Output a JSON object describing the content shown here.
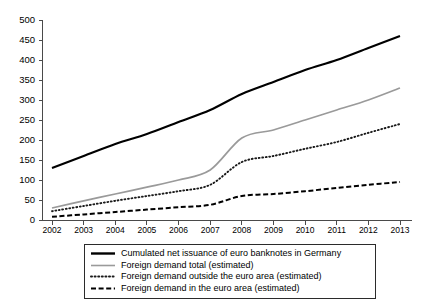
{
  "chart_data": {
    "type": "line",
    "title": "",
    "subtitle": "",
    "xlabel": "",
    "ylabel": "",
    "categories": [
      "2002",
      "2003",
      "2004",
      "2005",
      "2006",
      "2007",
      "2008",
      "2009",
      "2010",
      "2011",
      "2012",
      "2013"
    ],
    "x": [
      2002,
      2003,
      2004,
      2005,
      2006,
      2007,
      2008,
      2009,
      2010,
      2011,
      2012,
      2013
    ],
    "ylim": [
      0,
      500
    ],
    "yticks": [
      0,
      50,
      100,
      150,
      200,
      250,
      300,
      350,
      400,
      450,
      500
    ],
    "ytick_labels": [
      "0",
      "50",
      "100",
      "150",
      "200",
      "250",
      "300",
      "350",
      "400",
      "450",
      "500"
    ],
    "grid": false,
    "legend_position": "bottom",
    "series": [
      {
        "name": "Cumulated net issuance of euro banknotes in Germany",
        "style": "solid",
        "color": "#000000",
        "width": "thick",
        "values": [
          130,
          160,
          190,
          215,
          245,
          275,
          315,
          345,
          375,
          400,
          430,
          460
        ]
      },
      {
        "name": "Foreign demand total (estimated)",
        "style": "solid",
        "color": "#9a9a9a",
        "width": "thin",
        "values": [
          30,
          48,
          65,
          82,
          100,
          125,
          205,
          225,
          250,
          275,
          300,
          330
        ]
      },
      {
        "name": "Foreign demand outside the euro area (estimated)",
        "style": "dotted",
        "color": "#1a1a1a",
        "width": "medium",
        "values": [
          22,
          35,
          48,
          60,
          72,
          88,
          145,
          160,
          178,
          195,
          218,
          240
        ]
      },
      {
        "name": "Foreign demand in the euro area (estimated)",
        "style": "dashed",
        "color": "#000000",
        "width": "medium",
        "values": [
          8,
          14,
          20,
          26,
          32,
          38,
          60,
          65,
          72,
          80,
          88,
          95
        ]
      }
    ]
  },
  "legend": {
    "entries": [
      {
        "label": "Cumulated net issuance of euro banknotes in Germany",
        "style": "solid-thick",
        "color": "#000000"
      },
      {
        "label": "Foreign demand total (estimated)",
        "style": "solid-thin",
        "color": "#9a9a9a"
      },
      {
        "label": "Foreign demand outside the euro area (estimated)",
        "style": "dotted",
        "color": "#1a1a1a"
      },
      {
        "label": "Foreign demand in the euro area (estimated)",
        "style": "dashed",
        "color": "#000000"
      }
    ]
  },
  "colors": {
    "axis": "#4a4a4a",
    "text": "#000000",
    "background": "#ffffff",
    "legend_border": "#2b2b2b"
  }
}
